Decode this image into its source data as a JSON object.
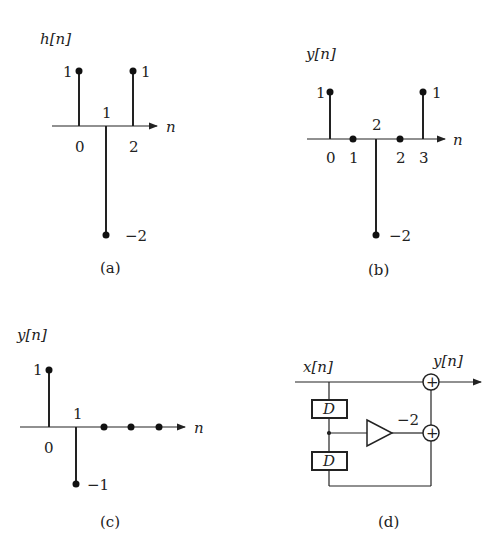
{
  "panels": {
    "a": {
      "caption": "(a)",
      "ylabel": "h[n]",
      "xlabel": "n",
      "stems": [
        {
          "n": 0,
          "value": 1,
          "value_label": "1",
          "tick_label": "0"
        },
        {
          "n": 1,
          "value": -2,
          "value_label": "−2",
          "tick_label": "1"
        },
        {
          "n": 2,
          "value": 1,
          "value_label": "1",
          "tick_label": "2"
        }
      ]
    },
    "b": {
      "caption": "(b)",
      "ylabel": "y[n]",
      "xlabel": "n",
      "stems": [
        {
          "n": 0,
          "value": 1,
          "value_label": "1",
          "tick_label": "0"
        },
        {
          "n": 1,
          "value": 0,
          "tick_label": "1"
        },
        {
          "n": 1.5,
          "value": -2,
          "value_label": "−2",
          "tick_label": "2"
        },
        {
          "n": 2,
          "value": 0,
          "tick_label": "2"
        },
        {
          "n": 3,
          "value": 1,
          "value_label": "1",
          "tick_label": "3"
        }
      ]
    },
    "c": {
      "caption": "(c)",
      "ylabel": "y[n]",
      "xlabel": "n",
      "stems": [
        {
          "n": 0,
          "value": 1,
          "value_label": "1",
          "tick_label": "0"
        },
        {
          "n": 1,
          "value": -1,
          "value_label": "−1",
          "tick_label": "1"
        },
        {
          "n": 2,
          "value": 0
        },
        {
          "n": 3,
          "value": 0
        },
        {
          "n": 4,
          "value": 0
        }
      ]
    },
    "d": {
      "caption": "(d)",
      "input_label": "x[n]",
      "output_label": "y[n]",
      "delay_label": "D",
      "gain_label": "−2",
      "adder_symbol": "+"
    }
  }
}
